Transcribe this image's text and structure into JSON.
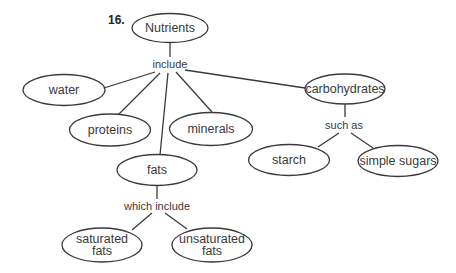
{
  "question_number": "16.",
  "colors": {
    "stroke": "#3a3a3a",
    "text": "#3a3a3a",
    "background": "#ffffff"
  },
  "nodes": {
    "nutrients": {
      "label": "Nutrients"
    },
    "water": {
      "label": "water"
    },
    "proteins": {
      "label": "proteins"
    },
    "minerals": {
      "label": "minerals"
    },
    "fats": {
      "label": "fats"
    },
    "carbohydrates": {
      "label": "carbohydrates"
    },
    "starch": {
      "label": "starch"
    },
    "simple_sugars": {
      "label": "simple sugars"
    },
    "saturated_fats": {
      "line1": "saturated",
      "line2": "fats"
    },
    "unsaturated_fats": {
      "line1": "unsaturated",
      "line2": "fats"
    }
  },
  "links": {
    "include": "include",
    "such_as": "such as",
    "which_include": "which include"
  }
}
